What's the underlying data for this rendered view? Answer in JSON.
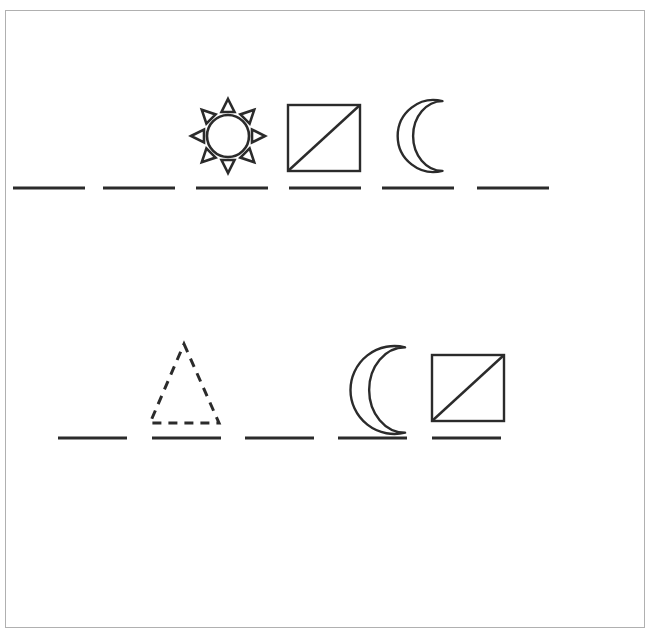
{
  "figure": {
    "width": 653,
    "height": 634,
    "background_color": "#ffffff",
    "stroke_color": "#2b2b2b",
    "frame_color": "#b0b0b0",
    "frame": {
      "x": 5,
      "y": 10,
      "width": 640,
      "height": 618
    }
  },
  "rows": [
    {
      "name": "top-row",
      "baseline": {
        "label": "top-dashed-baseline",
        "y": 188,
        "stroke_width": 3,
        "dash_count": 6,
        "dashes": [
          {
            "x1": 13,
            "x2": 85
          },
          {
            "x1": 103,
            "x2": 175
          },
          {
            "x1": 196,
            "x2": 268
          },
          {
            "x1": 289,
            "x2": 361
          },
          {
            "x1": 382,
            "x2": 454
          },
          {
            "x1": 477,
            "x2": 549
          }
        ]
      },
      "symbols": [
        {
          "icon": "sun-icon",
          "label": "sun",
          "style": "solid",
          "center_x": 228,
          "center_y": 136,
          "circle_radius": 21,
          "ray_count": 8,
          "outer_radius": 37
        },
        {
          "icon": "square-diagonal-icon",
          "label": "square with diagonal",
          "style": "solid",
          "x": 288,
          "y": 105,
          "width": 72,
          "height": 66,
          "diagonal": "bottom-left-to-top-right"
        },
        {
          "icon": "crescent-moon-icon",
          "label": "crescent moon",
          "style": "solid",
          "center_x": 413,
          "center_y": 136,
          "radius": 36,
          "opening": "right"
        }
      ]
    },
    {
      "name": "bottom-row",
      "baseline": {
        "label": "bottom-dashed-baseline",
        "y": 438,
        "stroke_width": 3,
        "dash_count": 5,
        "dashes": [
          {
            "x1": 58,
            "x2": 127
          },
          {
            "x1": 152,
            "x2": 221
          },
          {
            "x1": 245,
            "x2": 314
          },
          {
            "x1": 338,
            "x2": 407
          },
          {
            "x1": 432,
            "x2": 501
          }
        ]
      },
      "symbols": [
        {
          "icon": "triangle-icon",
          "label": "dashed triangle",
          "style": "dashed",
          "apex_x": 184,
          "apex_y": 344,
          "base_left_x": 150,
          "base_right_x": 219,
          "base_y": 423,
          "dash_pattern": "9 7"
        },
        {
          "icon": "crescent-moon-icon",
          "label": "crescent moon",
          "style": "solid",
          "center_x": 369,
          "center_y": 390,
          "radius": 44,
          "opening": "right"
        },
        {
          "icon": "square-diagonal-icon",
          "label": "square with diagonal",
          "style": "solid",
          "x": 432,
          "y": 355,
          "width": 72,
          "height": 66,
          "diagonal": "bottom-left-to-top-right"
        }
      ]
    }
  ]
}
